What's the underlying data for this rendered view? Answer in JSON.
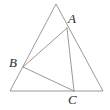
{
  "figure": {
    "background_color": "#ffffff",
    "stroke_color": "#9a9a9a",
    "stroke_width": 1,
    "label_color": "#2b2b2b",
    "canvas": {
      "width": 110,
      "height": 110
    },
    "outer_triangle": {
      "name": "outer-triangle",
      "vertices": [
        {
          "x": 56,
          "y": 4
        },
        {
          "x": 10,
          "y": 91
        },
        {
          "x": 103,
          "y": 91
        }
      ]
    },
    "inner_triangle": {
      "name": "inner-triangle",
      "vertices": [
        {
          "label": "A",
          "x": 67,
          "y": 28
        },
        {
          "label": "B",
          "x": 23,
          "y": 67
        },
        {
          "label": "C",
          "x": 74,
          "y": 91
        }
      ]
    },
    "labels": {
      "a": "A",
      "b": "B",
      "c": "C"
    }
  }
}
